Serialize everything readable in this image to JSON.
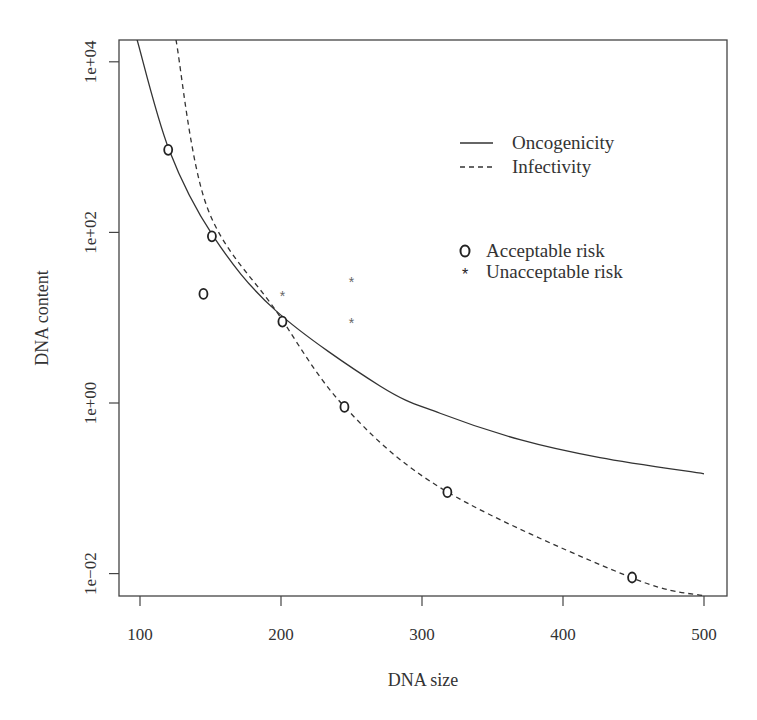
{
  "chart_data": {
    "type": "line",
    "title": "",
    "xlabel": "DNA size",
    "ylabel": "DNA content",
    "xscale": "linear",
    "yscale": "log",
    "xlim": [
      88,
      516
    ],
    "ylim_log10": [
      -2.25,
      4.3
    ],
    "x_ticks": [
      100,
      200,
      300,
      400,
      500
    ],
    "x_tick_labels": [
      "100",
      "200",
      "300",
      "400",
      "500"
    ],
    "y_ticks_log10": [
      -2,
      0,
      2,
      4
    ],
    "y_tick_labels": [
      "1e−02",
      "1e+00",
      "1e+02",
      "1e+04"
    ],
    "grid": false,
    "legend_position": "upper right (inside)",
    "series": [
      {
        "name": "Oncogenicity",
        "style": "solid",
        "x": [
          97.9,
          120.6,
          151.8,
          196.5,
          270.2,
          312.8,
          369.5,
          426.2,
          500
        ],
        "y_log10": [
          4.26,
          2.97,
          1.96,
          1.08,
          0.2,
          -0.12,
          -0.43,
          -0.64,
          -0.83
        ]
      },
      {
        "name": "Infectivity",
        "style": "dashed",
        "x": [
          125.5,
          147.5,
          196.5,
          245.4,
          317.7,
          448.9,
          500
        ],
        "y_log10": [
          4.26,
          2.3,
          1.08,
          -0.05,
          -1.04,
          -2.05,
          -2.26
        ]
      }
    ],
    "points": [
      {
        "group": "Acceptable risk",
        "marker": "circle",
        "x": 120,
        "y": 930
      },
      {
        "group": "Acceptable risk",
        "marker": "circle",
        "x": 151,
        "y": 90
      },
      {
        "group": "Acceptable risk",
        "marker": "circle",
        "x": 145,
        "y": 19
      },
      {
        "group": "Acceptable risk",
        "marker": "circle",
        "x": 201,
        "y": 9
      },
      {
        "group": "Acceptable risk",
        "marker": "circle",
        "x": 245,
        "y": 0.9
      },
      {
        "group": "Acceptable risk",
        "marker": "circle",
        "x": 318,
        "y": 0.09
      },
      {
        "group": "Acceptable risk",
        "marker": "circle",
        "x": 449,
        "y": 0.009
      },
      {
        "group": "Unacceptable risk",
        "marker": "star",
        "x": 201,
        "y": 18.5
      },
      {
        "group": "Unacceptable risk",
        "marker": "star",
        "x": 250,
        "y": 27
      },
      {
        "group": "Unacceptable risk",
        "marker": "star",
        "x": 250,
        "y": 9
      }
    ],
    "legend": {
      "lines": [
        {
          "label": "Oncogenicity",
          "style": "solid"
        },
        {
          "label": "Infectivity",
          "style": "dashed"
        }
      ],
      "markers": [
        {
          "label": "Acceptable risk",
          "symbol": "O"
        },
        {
          "label": "Unacceptable risk",
          "symbol": "*"
        }
      ]
    },
    "colors": {
      "line": "#333333",
      "marker": "#333333",
      "star": "#666666",
      "axis": "#333333"
    }
  }
}
